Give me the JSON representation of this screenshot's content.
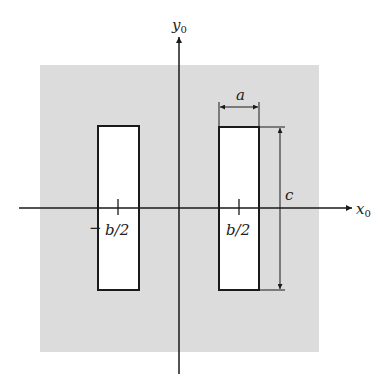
{
  "figure": {
    "type": "geometry-diagram",
    "colors": {
      "background": "#ffffff",
      "screen": "#dcdcdc",
      "aperture": "#ffffff",
      "stroke": "#1a1a1a"
    }
  },
  "axes": {
    "x": {
      "label": "x",
      "subscript": "0"
    },
    "y": {
      "label": "y",
      "subscript": "0"
    }
  },
  "apertures": [
    {
      "name": "left-aperture",
      "center_label": "−b/2",
      "center_label_sign": "−",
      "center_label_text": "b/2"
    },
    {
      "name": "right-aperture",
      "center_label": "b/2",
      "center_label_text": "b/2"
    }
  ],
  "dimensions": {
    "width": {
      "label": "a"
    },
    "height": {
      "label": "c"
    }
  }
}
